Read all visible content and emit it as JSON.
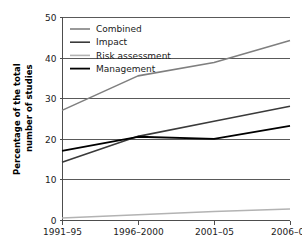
{
  "chart_data": {
    "type": "line",
    "title": "",
    "xlabel": "",
    "ylabel": "Percentage of the total number of studies",
    "ylabel_line1": "Percentage of the total",
    "ylabel_line2": "number of studies",
    "categories": [
      "1991–95",
      "1996–2000",
      "2001–05",
      "2006–09"
    ],
    "ylim": [
      0,
      50
    ],
    "yticks": [
      0,
      10,
      20,
      30,
      40,
      50
    ],
    "ytick_labels": [
      "0",
      "10",
      "20",
      "30",
      "40",
      "50"
    ],
    "grid": "horizontal",
    "legend_position": "top-left",
    "series": [
      {
        "name": "Combined",
        "color": "#7f7f7f",
        "width": 1.6,
        "values": [
          27,
          35.5,
          38.8,
          44.2
        ]
      },
      {
        "name": "Impact",
        "color": "#3a3a3a",
        "width": 1.6,
        "values": [
          14.2,
          20.6,
          24.3,
          28
        ]
      },
      {
        "name": "Risk assessment",
        "color": "#b3b3b3",
        "width": 1.6,
        "values": [
          0.5,
          1.3,
          2.1,
          2.7
        ]
      },
      {
        "name": "Management",
        "color": "#000000",
        "width": 1.8,
        "values": [
          17,
          20.5,
          20,
          23.2
        ]
      }
    ]
  },
  "legend": {
    "items": [
      {
        "label": "Combined",
        "color": "#7f7f7f"
      },
      {
        "label": "Impact",
        "color": "#3a3a3a"
      },
      {
        "label": "Risk assessment",
        "color": "#b3b3b3"
      },
      {
        "label": "Management",
        "color": "#000000"
      }
    ]
  }
}
